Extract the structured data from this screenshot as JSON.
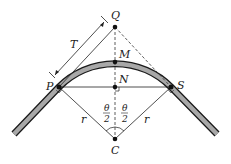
{
  "diagram": {
    "points": {
      "Q": {
        "label": "Q",
        "x": 115,
        "y": 27
      },
      "M": {
        "label": "M",
        "x": 115,
        "y": 62
      },
      "N": {
        "label": "N",
        "x": 115,
        "y": 87
      },
      "P": {
        "label": "P",
        "x": 59,
        "y": 87
      },
      "S": {
        "label": "S",
        "x": 171,
        "y": 87
      },
      "C": {
        "label": "C",
        "x": 115,
        "y": 139
      }
    },
    "labels": {
      "tangent_length": "T",
      "radius_left": "r",
      "radius_right": "r",
      "half_angle_num_left": "θ",
      "half_angle_den_left": "2",
      "half_angle_num_right": "θ",
      "half_angle_den_right": "2"
    },
    "colors": {
      "road_fill": "#a8a8a8",
      "road_edge": "#1a1a1a",
      "line": "#222222",
      "dashed": "#333333",
      "point": "#111111"
    }
  }
}
